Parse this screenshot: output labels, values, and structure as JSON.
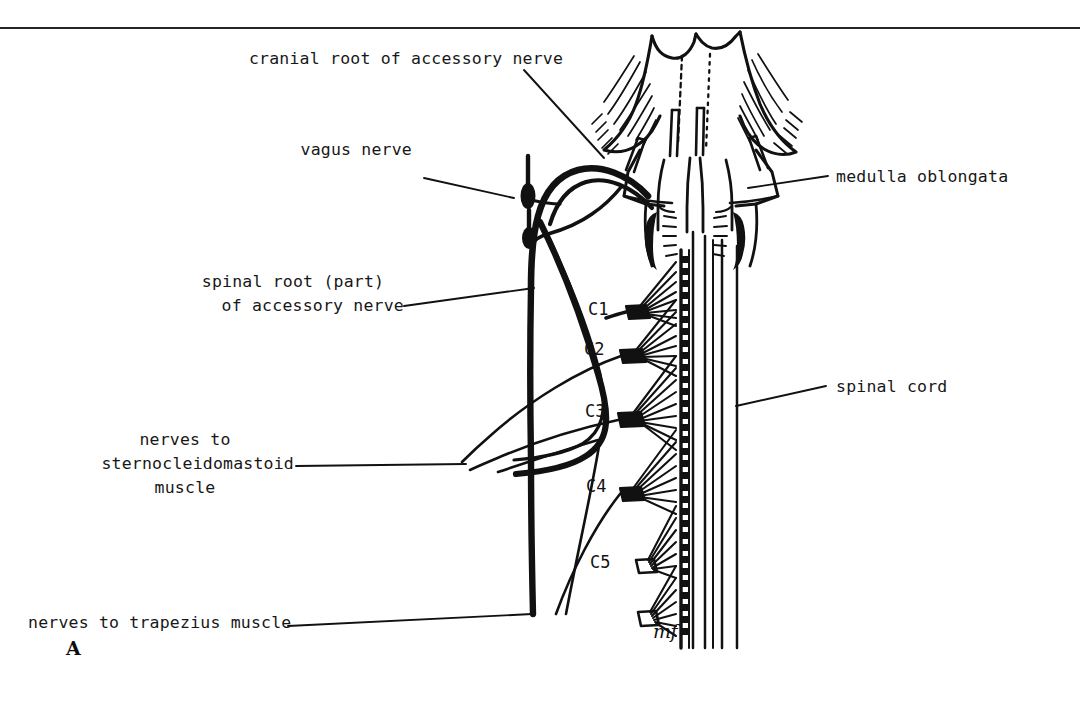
{
  "figure": {
    "panel_letter": "A",
    "artist_signature": "mf",
    "background_color": "#ffffff",
    "ink_color": "#111111",
    "rule_color": "#262626"
  },
  "labels": {
    "cranial_root": "cranial root of accessory nerve",
    "vagus": "vagus nerve",
    "spinal_root_line1": "spinal root (part)",
    "spinal_root_line2": "of accessory nerve",
    "scm_line1": "nerves to",
    "scm_line2": "sternocleidomastoid",
    "scm_line3": "muscle",
    "trapezius": "nerves to trapezius muscle",
    "medulla": "medulla oblongata",
    "spinal_cord": "spinal cord"
  },
  "segments": [
    {
      "id": "c1",
      "label": "C1"
    },
    {
      "id": "c2",
      "label": "C2"
    },
    {
      "id": "c3",
      "label": "C3"
    },
    {
      "id": "c4",
      "label": "C4"
    },
    {
      "id": "c5",
      "label": "C5"
    }
  ],
  "diagram_data": {
    "type": "anatomical-line-drawing",
    "subject": "cranial and spinal roots of the accessory nerve (CN XI) in relation to the medulla oblongata and cervical spinal cord",
    "view": "posterior",
    "structures": [
      "cerebellum (cut surface, hatched)",
      "medulla oblongata",
      "spinal cord",
      "cranial root of accessory nerve",
      "spinal root of accessory nerve",
      "vagus nerve with superior and inferior ganglia",
      "cervical spinal nerve roots C1 to C5",
      "denticulate ligament",
      "nerves to sternocleidomastoid muscle",
      "nerves to trapezius muscle"
    ]
  }
}
